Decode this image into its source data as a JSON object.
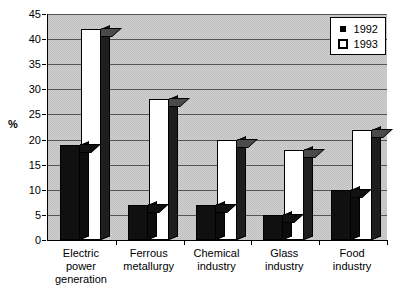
{
  "chart_data": {
    "type": "bar",
    "title": "",
    "subtitle": "",
    "xlabel": "",
    "ylabel": "%",
    "ylim": [
      0,
      45
    ],
    "ytick_step": 5,
    "yticks": [
      "0",
      "5",
      "10",
      "15",
      "20",
      "25",
      "30",
      "35",
      "40",
      "45"
    ],
    "grid": true,
    "legend_position": "top-right",
    "categories": [
      "Electric power generation",
      "Ferrous metallurgy",
      "Chemical industry",
      "Glass industry",
      "Food industry"
    ],
    "series": [
      {
        "name": "1992",
        "color": "#101010",
        "values": [
          19,
          7,
          7,
          5,
          10
        ]
      },
      {
        "name": "1993",
        "color": "#ffffff",
        "values": [
          42,
          28,
          20,
          18,
          22
        ]
      }
    ]
  },
  "legend": {
    "items": [
      {
        "label": "1992",
        "swatch": "filled-black-square-icon"
      },
      {
        "label": "1993",
        "swatch": "outlined-white-square-icon"
      }
    ]
  },
  "axes": {
    "y_title": "%"
  },
  "category_lines": [
    [
      "Electric",
      "power",
      "generation"
    ],
    [
      "Ferrous",
      "metallurgy",
      ""
    ],
    [
      "Chemical",
      "industry",
      ""
    ],
    [
      "Glass",
      "industry",
      ""
    ],
    [
      "Food",
      "industry",
      ""
    ]
  ]
}
